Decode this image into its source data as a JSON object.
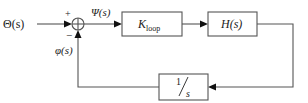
{
  "diagram": {
    "type": "feedback-control-block-diagram",
    "input_signal": "Θ(s)",
    "error_signal": "Ψ(s)",
    "feedback_signal": "φ(s)",
    "summing_junction": {
      "plus_sign": "+",
      "minus_sign": "−"
    },
    "blocks": [
      {
        "id": "k-loop",
        "label_main": "K",
        "label_sub": "loop"
      },
      {
        "id": "h",
        "label": "H(s)"
      },
      {
        "id": "integrator",
        "numerator": "1",
        "denominator": "s"
      }
    ],
    "connections": [
      {
        "from": "input",
        "to": "summing-junction",
        "sign": "+"
      },
      {
        "from": "summing-junction",
        "to": "k-loop"
      },
      {
        "from": "k-loop",
        "to": "h"
      },
      {
        "from": "h",
        "to": "integrator"
      },
      {
        "from": "integrator",
        "to": "summing-junction",
        "sign": "−"
      }
    ]
  }
}
